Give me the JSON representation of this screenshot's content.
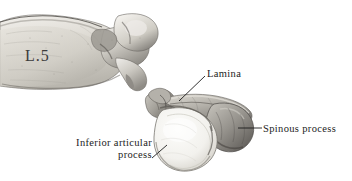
{
  "figure": {
    "background_color": "#ffffff",
    "text_color": "#1c1c1c",
    "specimen_label": "L.5",
    "annotations": {
      "lamina": "Lamina",
      "spinous_process": "Spinous process",
      "inferior_articular_line1": "Inferior articular",
      "inferior_articular_line2": "process"
    },
    "bone_tones": {
      "highlight": "#fbfbf9",
      "light": "#e9e7e2",
      "mid": "#c2bfb8",
      "shadow": "#8e8b85",
      "deep_shadow": "#5d5a56",
      "outline": "#6a6762"
    }
  }
}
